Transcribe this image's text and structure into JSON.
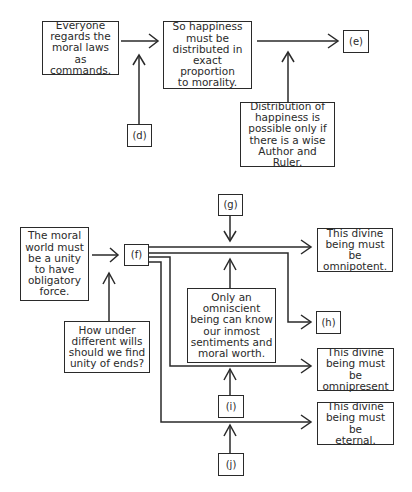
{
  "diagram": {
    "top_section": {
      "moral_laws": "Everyone\nregards the\nmoral laws as\ncommands.",
      "happiness_proportion": "So happiness\nmust be\ndistributed in\nexact proportion\nto morality.",
      "label_e": "(e)",
      "label_d": "(d)",
      "distribution": "Distribution of\nhappiness is\npossible only if\nthere is a wise\nAuthor and Ruler."
    },
    "bottom_section": {
      "moral_world": "The moral\nworld must\nbe a unity\nto have\nobligatory\nforce.",
      "label_f": "(f)",
      "label_g": "(g)",
      "label_h": "(h)",
      "label_i": "(i)",
      "label_j": "(j)",
      "unity_question": "How under\ndifferent wills\nshould we find\nunity of ends?",
      "omniscient": "Only an\nomniscient\nbeing can know\nour inmost\nsentiments and\nmoral worth.",
      "omnipotent": "This divine\nbeing must be\nomnipotent.",
      "omnipresent": "This divine\nbeing must be\nomnipresent",
      "eternal": "This divine\nbeing must be\neternal."
    },
    "colors": {
      "stroke": "#2a2a2a",
      "background": "#ffffff"
    }
  }
}
